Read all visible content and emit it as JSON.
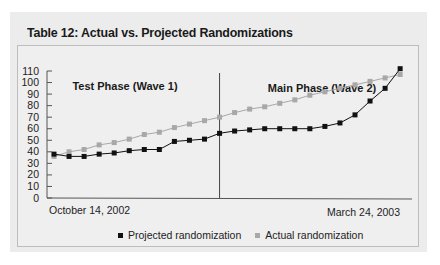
{
  "title": "Table 12: Actual vs. Projected Randomizations",
  "colors": {
    "projected": "#111111",
    "actual": "#a8a8a8",
    "axis": "#333333"
  },
  "chart_data": {
    "type": "line",
    "title": "Table 12: Actual vs. Projected Randomizations",
    "xlabel": "",
    "ylabel": "",
    "ylim": [
      0,
      110
    ],
    "yticks": [
      0,
      10,
      20,
      30,
      40,
      50,
      60,
      70,
      80,
      90,
      100,
      110
    ],
    "x_start_label": "October 14, 2002",
    "x_end_label": "March 24, 2003",
    "grid": false,
    "legend_position": "bottom",
    "annotations": [
      {
        "text": "Test Phase (Wave 1)",
        "region": "left"
      },
      {
        "text": "Main Phase (Wave 2)",
        "region": "right"
      },
      {
        "type": "vertical-divider",
        "at_index": 11
      }
    ],
    "x": [
      1,
      2,
      3,
      4,
      5,
      6,
      7,
      8,
      9,
      10,
      11,
      12,
      13,
      14,
      15,
      16,
      17,
      18,
      19,
      20,
      21,
      22,
      23,
      24
    ],
    "series": [
      {
        "name": "Projected randomization",
        "marker": "square",
        "color": "#111111",
        "values": [
          38,
          36,
          36,
          38,
          39,
          41,
          42,
          42,
          49,
          50,
          51,
          56,
          58,
          59,
          60,
          60,
          60,
          60,
          62,
          65,
          72,
          84,
          95,
          112
        ]
      },
      {
        "name": "Actual randomization",
        "marker": "square",
        "color": "#a8a8a8",
        "values": [
          36,
          40,
          42,
          46,
          48,
          51,
          55,
          57,
          61,
          64,
          67,
          70,
          74,
          77,
          79,
          82,
          85,
          89,
          92,
          95,
          98,
          101,
          104,
          107
        ]
      }
    ]
  },
  "legend": [
    {
      "label": "Projected randomization"
    },
    {
      "label": "Actual randomization"
    }
  ]
}
